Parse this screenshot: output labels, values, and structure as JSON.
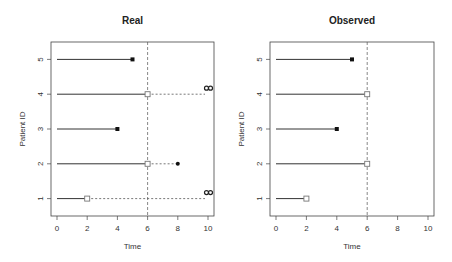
{
  "chart_data": [
    {
      "type": "line",
      "subtype": "swimmer/segment plot",
      "title": "Real",
      "xlabel": "Time",
      "ylabel": "Patient ID",
      "xlim": [
        0,
        10
      ],
      "ylim": [
        0.5,
        5.5
      ],
      "xticks": [
        0,
        2,
        4,
        6,
        8,
        10
      ],
      "yticks": [
        1,
        2,
        3,
        4,
        5
      ],
      "reference_line": {
        "x": 6,
        "style": "dashed"
      },
      "patients": [
        {
          "id": 1,
          "solid_end": 2,
          "marker_at_solid_end": "open-square",
          "dashed_to": 10,
          "end_marker": "infinity"
        },
        {
          "id": 2,
          "solid_end": 6,
          "marker_at_solid_end": "open-square",
          "dashed_to": 8,
          "end_marker": "filled-dot"
        },
        {
          "id": 3,
          "solid_end": 4,
          "marker_at_solid_end": "filled-square",
          "dashed_to": null,
          "end_marker": null
        },
        {
          "id": 4,
          "solid_end": 6,
          "marker_at_solid_end": "open-square",
          "dashed_to": 10,
          "end_marker": "infinity"
        },
        {
          "id": 5,
          "solid_end": 5,
          "marker_at_solid_end": "filled-square",
          "dashed_to": null,
          "end_marker": null
        }
      ],
      "grid": false,
      "legend": null
    },
    {
      "type": "line",
      "subtype": "swimmer/segment plot",
      "title": "Observed",
      "xlabel": "Time",
      "ylabel": "Patient ID",
      "xlim": [
        0,
        10
      ],
      "ylim": [
        0.5,
        5.5
      ],
      "xticks": [
        0,
        2,
        4,
        6,
        8,
        10
      ],
      "yticks": [
        1,
        2,
        3,
        4,
        5
      ],
      "reference_line": {
        "x": 6,
        "style": "dashed"
      },
      "patients": [
        {
          "id": 1,
          "solid_end": 2,
          "end_marker": "open-square"
        },
        {
          "id": 2,
          "solid_end": 6,
          "end_marker": "open-square"
        },
        {
          "id": 3,
          "solid_end": 4,
          "end_marker": "filled-square"
        },
        {
          "id": 4,
          "solid_end": 6,
          "end_marker": "open-square"
        },
        {
          "id": 5,
          "solid_end": 5,
          "end_marker": "filled-square"
        }
      ],
      "grid": false,
      "legend": null
    }
  ],
  "labels": {
    "left_title": "Real",
    "right_title": "Observed",
    "xlabel": "Time",
    "ylabel": "Patient ID",
    "infinity": "∞"
  },
  "colors": {
    "segment": "#333333",
    "dashed": "#555555",
    "frame": "#444444",
    "open_marker": "#777777",
    "filled_marker": "#111111"
  }
}
